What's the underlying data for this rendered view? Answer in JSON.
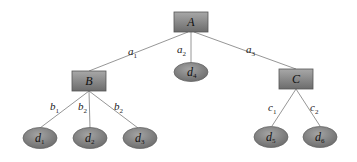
{
  "diagram": {
    "type": "tree",
    "colors": {
      "node_fill_top": "#a6a6a6",
      "node_fill_bottom": "#6f6f6f",
      "edge": "#8a8a8a",
      "text": "#111111"
    },
    "nodes": {
      "A": {
        "base": "A",
        "sub": "",
        "shape": "box"
      },
      "B": {
        "base": "B",
        "sub": "",
        "shape": "box"
      },
      "C": {
        "base": "C",
        "sub": "",
        "shape": "box"
      },
      "d1": {
        "base": "d",
        "sub": "1",
        "shape": "ellipse"
      },
      "d2": {
        "base": "d",
        "sub": "2",
        "shape": "ellipse"
      },
      "d3": {
        "base": "d",
        "sub": "3",
        "shape": "ellipse"
      },
      "d4": {
        "base": "d",
        "sub": "4",
        "shape": "ellipse"
      },
      "d5": {
        "base": "d",
        "sub": "5",
        "shape": "ellipse"
      },
      "d6": {
        "base": "d",
        "sub": "6",
        "shape": "ellipse"
      }
    },
    "edges": {
      "A_B": {
        "from": "A",
        "to": "B",
        "base": "a",
        "sub": "1"
      },
      "A_d4": {
        "from": "A",
        "to": "d4",
        "base": "a",
        "sub": "2"
      },
      "A_C": {
        "from": "A",
        "to": "C",
        "base": "a",
        "sub": "3"
      },
      "B_d1": {
        "from": "B",
        "to": "d1",
        "base": "b",
        "sub": "1"
      },
      "B_d2": {
        "from": "B",
        "to": "d2",
        "base": "b",
        "sub": "2"
      },
      "B_d3": {
        "from": "B",
        "to": "d3",
        "base": "b",
        "sub": "2"
      },
      "C_d5": {
        "from": "C",
        "to": "d5",
        "base": "c",
        "sub": "1"
      },
      "C_d6": {
        "from": "C",
        "to": "d6",
        "base": "c",
        "sub": "2"
      }
    }
  }
}
